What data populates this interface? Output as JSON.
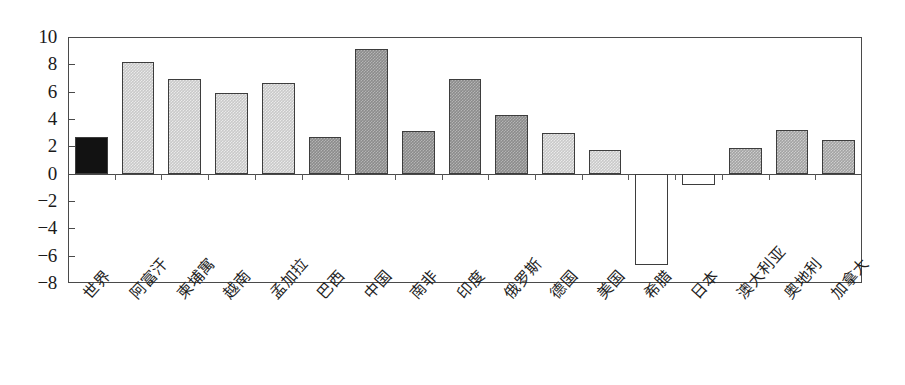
{
  "chart_data": {
    "type": "bar",
    "title": "",
    "subtitle": "",
    "xlabel": "",
    "ylabel": "",
    "ylim": [
      -8,
      10
    ],
    "grid": false,
    "legend": "none",
    "y_ticks": [
      10,
      8,
      6,
      4,
      2,
      0,
      -2,
      -4,
      -6,
      -8
    ],
    "y_tick_labels": [
      "10",
      "8",
      "6",
      "4",
      "2",
      "0",
      "−2",
      "−4",
      "−6",
      "−8"
    ],
    "categories": [
      "世界",
      "阿富汗",
      "柬埔寓",
      "越南",
      "孟加拉",
      "巴西",
      "中国",
      "南非",
      "印度",
      "俄罗斯",
      "德国",
      "美国",
      "希腊",
      "日本",
      "澳大利亚",
      "奥地利",
      "加拿大"
    ],
    "values": [
      2.7,
      8.15,
      6.95,
      5.9,
      6.65,
      2.7,
      9.1,
      3.15,
      6.9,
      4.3,
      3.0,
      1.75,
      -6.7,
      -0.8,
      1.9,
      3.2,
      2.5
    ],
    "bar_styles": [
      "solid-black",
      "light-gray",
      "light-gray",
      "light-gray",
      "light-gray",
      "dark-gray",
      "dark-gray",
      "dark-gray",
      "dark-gray",
      "dark-gray",
      "light-gray",
      "light-gray",
      "white-fill",
      "white-fill",
      "medium-gray",
      "medium-gray",
      "medium-gray"
    ],
    "colors": {
      "solid-black": "#121212",
      "light-gray": "#c9c9c9",
      "dark-gray": "#8b8b8b",
      "medium-gray": "#a3a3a3",
      "white-fill": "#ffffff",
      "axis": "#4a4a4a",
      "background": "#ffffff"
    }
  }
}
